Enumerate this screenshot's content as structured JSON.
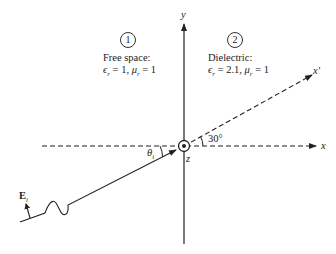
{
  "figure": {
    "axes": {
      "x_label": "x",
      "y_label": "y",
      "z_label": "z",
      "x_prime_label": "x′"
    },
    "regions": [
      {
        "number": "1",
        "name": "Free space:",
        "params": "ϵr = 1, μr = 1",
        "epsilon_r": "1",
        "mu_r": "1"
      },
      {
        "number": "2",
        "name": "Dielectric:",
        "params": "ϵr = 2.1, μr = 1",
        "epsilon_r": "2.1",
        "mu_r": "1"
      }
    ],
    "angles": {
      "incidence_label": "θi",
      "rotation_label": "30°"
    },
    "field_label": "Ei",
    "colors": {
      "ink": "#222222",
      "background": "#ffffff"
    }
  }
}
